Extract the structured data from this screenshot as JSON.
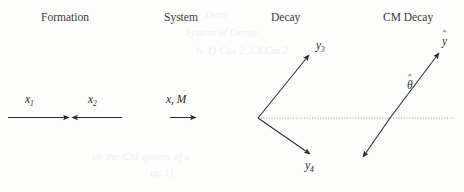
{
  "figure": {
    "background_color": "#fdfdfc",
    "ink_color": "#2b2b2b",
    "dotted_line_color": "#8a8a8a",
    "width": 464,
    "height": 192
  },
  "headings": {
    "formation": "Formation",
    "system": "System",
    "decay": "Decay",
    "cm_decay": "CM Decay"
  },
  "formation": {
    "label_x1_base": "x",
    "label_x1_sub": "1",
    "label_x2_base": "x",
    "label_x2_sub": "2"
  },
  "system": {
    "label": "x, M"
  },
  "decay": {
    "label_y3_base": "y",
    "label_y3_sub": "3",
    "label_y4_base": "y",
    "label_y4_sub": "4"
  },
  "cm_decay": {
    "label_yhat_base": "y",
    "label_yhat_accent": "ˆ",
    "label_thetahat_base": "θ",
    "label_thetahat_accent": "ˆ"
  },
  "bleed_through": {
    "line_1": "Dece",
    "line_2": "System of Decay",
    "line_3": "b. 1)   Cas 2:2.3 Cm 2",
    "line_4": "on the CM system of a",
    "line_5": "ig. 1)"
  }
}
